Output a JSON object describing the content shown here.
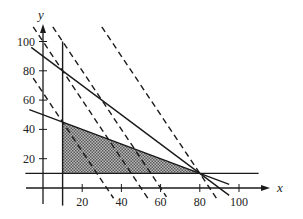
{
  "chart_data": {
    "type": "line",
    "title": "",
    "xlabel": "x",
    "ylabel": "y",
    "x_ticks": [
      20,
      40,
      60,
      80,
      100
    ],
    "y_ticks": [
      20,
      40,
      60,
      80,
      100
    ],
    "xlim": [
      -9,
      112
    ],
    "ylim": [
      -12,
      112
    ],
    "grid": false,
    "legend": null,
    "constraint_lines": [
      {
        "name": "x = 10",
        "style": "solid",
        "equation": "x = 10",
        "from": [
          10,
          100
        ],
        "to": [
          10,
          -12
        ]
      },
      {
        "name": "y = 10",
        "style": "solid",
        "equation": "y = 10",
        "from": [
          -9,
          10
        ],
        "to": [
          110,
          10
        ]
      },
      {
        "name": "x + y = 90",
        "style": "solid",
        "equation": "y = 90 - x",
        "from": [
          -6,
          96
        ],
        "to": [
          95,
          -5
        ]
      },
      {
        "name": "x + 2y = 100",
        "style": "solid",
        "equation": "y = 50 - 0.5x",
        "from": [
          -7,
          53.5
        ],
        "to": [
          95,
          2.5
        ]
      }
    ],
    "objective_lines": [
      {
        "name": "2x + y = 65",
        "style": "dashed",
        "equation": "y = 65 - 2x",
        "from": [
          -5,
          75
        ],
        "to": [
          36,
          -7
        ]
      },
      {
        "name": "2x + y = 100",
        "style": "dashed",
        "equation": "y = 100 - 2x",
        "from": [
          -5,
          110
        ],
        "to": [
          54,
          -8
        ]
      },
      {
        "name": "2x + y = 120",
        "style": "dashed",
        "equation": "y = 120 - 2x",
        "from": [
          5,
          110
        ],
        "to": [
          63,
          -6
        ]
      },
      {
        "name": "2x + y = 170",
        "style": "dashed",
        "equation": "y = 170 - 2x",
        "from": [
          30,
          110
        ],
        "to": [
          89,
          -8
        ]
      }
    ],
    "feasible_region": {
      "fill": "crosshatch",
      "vertices": [
        [
          10,
          45
        ],
        [
          80,
          10
        ],
        [
          10,
          10
        ]
      ]
    }
  },
  "axes": {
    "x_label": "x",
    "y_label": "y",
    "x_tick_labels": [
      "20",
      "40",
      "60",
      "80",
      "100"
    ],
    "y_tick_labels": [
      "20",
      "40",
      "60",
      "80",
      "100"
    ]
  },
  "colors": {
    "line": "#1a1a1a",
    "region": "#9a9a9a",
    "background": "#ffffff"
  }
}
